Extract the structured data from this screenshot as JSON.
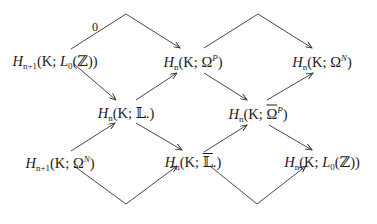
{
  "diagram": {
    "type": "commutative-diagram",
    "nodes": [
      {
        "id": "a1",
        "label": "H_{n+1}(K; L_0(ℤ))",
        "H": "H",
        "sub": "n+1",
        "pre": "(K; ",
        "mid": "L",
        "midsub": "0",
        "post": "(ℤ))",
        "x": 55,
        "y": 62
      },
      {
        "id": "a2",
        "label": "H_n(K; Ω.^P)",
        "H": "H",
        "sub": "n",
        "pre": "(K; ",
        "mid": "Ω",
        "sup": "P",
        "post": ")",
        "x": 193,
        "y": 62
      },
      {
        "id": "a3",
        "label": "H_n(K; Ω.^N)",
        "H": "H",
        "sub": "n",
        "pre": "(K; ",
        "mid": "Ω",
        "sup": "N",
        "post": ")",
        "x": 322,
        "y": 62
      },
      {
        "id": "b1",
        "label": "H_n(K; 𝕃.)",
        "H": "H",
        "sub": "n",
        "pre": "(K; ",
        "mid": "𝕃.",
        "post": ")",
        "x": 126,
        "y": 114
      },
      {
        "id": "b2",
        "label": "H_n(K; Ω̄.^P)",
        "H": "H",
        "sub": "n",
        "pre": "(K; ",
        "mid": "Ω",
        "sup": "P",
        "post": ")",
        "x": 258,
        "y": 114
      },
      {
        "id": "c1",
        "label": "H_{n+1}(K; Ω.^N)",
        "H": "H",
        "sub": "n+1",
        "pre": "(K; ",
        "mid": "Ω",
        "sup": "N",
        "post": ")",
        "x": 60,
        "y": 163
      },
      {
        "id": "c2",
        "label": "H_n(K; 𝕃̄.)",
        "H": "H",
        "sub": "n",
        "pre": "(K; ",
        "mid": "𝕃",
        "post": ".)",
        "x": 193,
        "y": 163
      },
      {
        "id": "c3",
        "label": "H_n(K; L_0(ℤ))",
        "H": "H",
        "sub": "n",
        "pre": "(K; ",
        "mid": "L",
        "midsub": "0",
        "post": "(ℤ))",
        "x": 322,
        "y": 163
      }
    ],
    "edges": [
      {
        "from": "a1",
        "to": "a2",
        "label": "0",
        "path": "71,49 126,14 180,48"
      },
      {
        "from": "a2",
        "to": "a3",
        "label": "",
        "path": "204,48 258,14 312,48"
      },
      {
        "from": "a1",
        "to": "b1",
        "label": "",
        "path": "74,64 116,100"
      },
      {
        "from": "b1",
        "to": "a2",
        "label": "",
        "path": "136,100 177,73"
      },
      {
        "from": "a2",
        "to": "b2",
        "label": "",
        "path": "204,73 247,100"
      },
      {
        "from": "b2",
        "to": "a3",
        "label": "",
        "path": "267,100 313,73"
      },
      {
        "from": "c1",
        "to": "b1",
        "label": "",
        "path": "71,151 115,123"
      },
      {
        "from": "b1",
        "to": "c2",
        "label": "",
        "path": "136,123 182,150"
      },
      {
        "from": "c2",
        "to": "b2",
        "label": "",
        "path": "204,152 247,125"
      },
      {
        "from": "b2",
        "to": "c3",
        "label": "",
        "path": "269,125 312,150"
      },
      {
        "from": "c1",
        "to": "c2",
        "label": "",
        "path": "74,166 126,204 177,166"
      },
      {
        "from": "c2",
        "to": "c3",
        "label": "",
        "path": "210,166 257,204 306,166"
      }
    ],
    "edge_label_zero": "0"
  }
}
